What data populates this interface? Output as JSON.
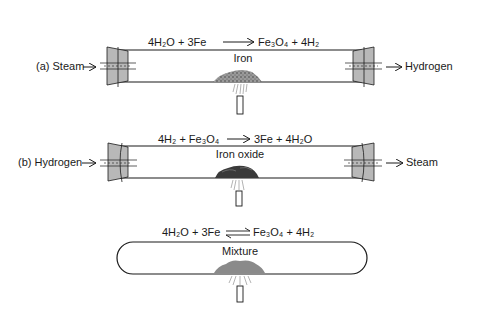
{
  "panels": [
    {
      "id": "a",
      "equation": {
        "lhs": "4H₂O + 3Fe",
        "arrow": "→",
        "rhs": "Fe₃O₄ + 4H₂"
      },
      "tube_label": "Iron",
      "inlet_label": "(a) Steam",
      "outlet_label": "Hydrogen"
    },
    {
      "id": "b",
      "equation": {
        "lhs": "4H₂ + Fe₃O₄",
        "arrow": "→",
        "rhs": "3Fe + 4H₂O"
      },
      "tube_label": "Iron oxide",
      "inlet_label": "(b) Hydrogen",
      "outlet_label": "Steam"
    },
    {
      "id": "c",
      "equation": {
        "lhs": "4H₂O + 3Fe",
        "arrow": "⇌",
        "rhs": "Fe₃O₄ + 4H₂"
      },
      "tube_label": "Mixture"
    }
  ],
  "colors": {
    "stroke": "#1a1a1a",
    "stopper": "#b8b8b8",
    "pile": "#8a8a8a",
    "pile_dark": "#3a3a3a"
  }
}
